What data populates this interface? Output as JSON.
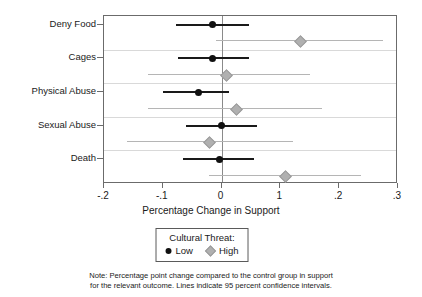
{
  "chart_data": {
    "type": "scatter",
    "title": "",
    "xlabel": "Percentage Change in Support",
    "ylabel": "",
    "xlim": [
      -0.2,
      0.3
    ],
    "xticks": [
      -0.2,
      -0.1,
      0,
      0.1,
      0.2,
      0.3
    ],
    "xticklabels": [
      "-.2",
      "-.1",
      "0",
      "1",
      ".2",
      ".3"
    ],
    "categories": [
      "Deny Food",
      "Cages",
      "Physical Abuse",
      "Sexual Abuse",
      "Death"
    ],
    "grid": true,
    "grid_axis": "y",
    "zero_reference_line": 0,
    "legend_position": "below-axis",
    "orientation": "horizontal",
    "series": [
      {
        "name": "Low",
        "color": "#111111",
        "marker": "circle",
        "values": [
          -0.016,
          -0.016,
          -0.04,
          0.0,
          -0.003
        ],
        "ci_low": [
          -0.078,
          -0.074,
          -0.099,
          -0.061,
          -0.066
        ],
        "ci_high": [
          0.047,
          0.047,
          0.012,
          0.061,
          0.055
        ]
      },
      {
        "name": "High",
        "color": "#b0b0b0",
        "marker": "diamond",
        "values": [
          0.133,
          0.007,
          0.024,
          -0.022,
          0.107
        ],
        "ci_low": [
          -0.009,
          -0.126,
          -0.126,
          -0.161,
          -0.022
        ],
        "ci_high": [
          0.275,
          0.15,
          0.171,
          0.121,
          0.237
        ]
      }
    ]
  },
  "legend": {
    "title": "Cultural Threat:",
    "entries": [
      {
        "label": "Low"
      },
      {
        "label": "High"
      }
    ]
  },
  "note": {
    "line1": "Note: Percentage point change compared to the control group in support",
    "line2": "for the relevant outcome. Lines indicate 95 percent confidence intervals."
  }
}
